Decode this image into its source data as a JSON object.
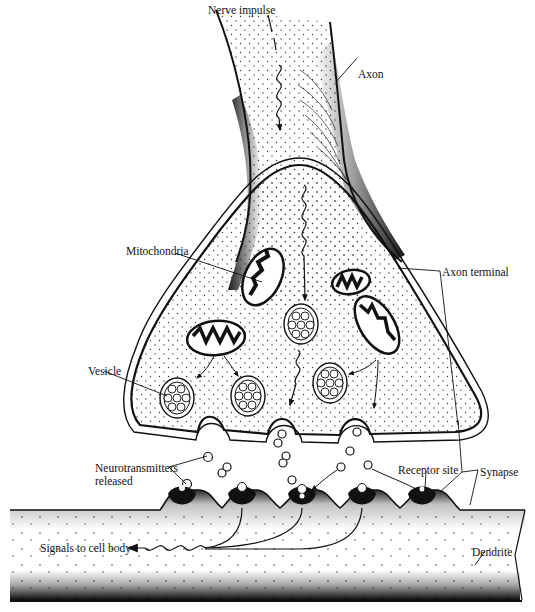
{
  "diagram": {
    "type": "biology-illustration",
    "labels": {
      "nerve_impulse": "Nerve impulse",
      "axon": "Axon",
      "mitochondria": "Mitochondria",
      "axon_terminal": "Axon terminal",
      "vesicle": "Vesicle",
      "neurotransmitters_line1": "Neurotransmitters",
      "neurotransmitters_line2": "released",
      "receptor_site": "Receptor site",
      "synapse": "Synapse",
      "signals_to_cell_body": "Signals to cell body",
      "dendrite": "Dendrite"
    },
    "colors": {
      "ink": "#111111",
      "background": "#ffffff",
      "stipple": "#222222"
    }
  }
}
